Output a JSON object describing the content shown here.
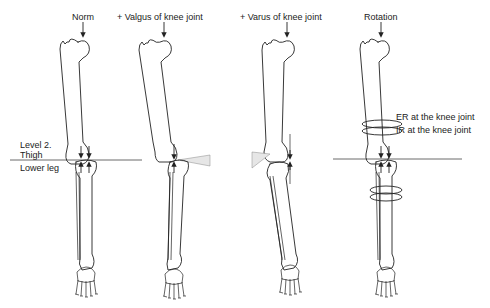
{
  "figure": {
    "panels": [
      {
        "id": "norm",
        "title": "Norm"
      },
      {
        "id": "valgus",
        "title": "+ Valgus of knee joint"
      },
      {
        "id": "varus",
        "title": "+ Varus of knee joint"
      },
      {
        "id": "rotation",
        "title": "Rotation"
      }
    ],
    "level_labels": {
      "level": "Level 2.",
      "upper": "Thigh",
      "lower": "Lower leg"
    },
    "rotation_labels": {
      "er": "ER at the knee joint",
      "ir": "IR at the knee joint"
    }
  }
}
